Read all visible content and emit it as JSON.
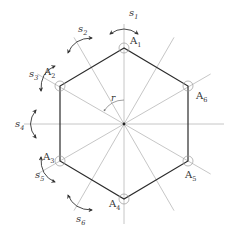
{
  "diagram": {
    "center": {
      "x": 124,
      "y": 124
    },
    "radius": 76,
    "colors": {
      "hexagon": "#2b2b2b",
      "axis": "#b8b8b8",
      "arrow": "#333333",
      "circle": "#999999"
    },
    "vertices": [
      {
        "label": "A",
        "sub": "1",
        "x": 124,
        "y": 48,
        "lx": 130,
        "ly": 44
      },
      {
        "label": "A",
        "sub": "2",
        "x": 60,
        "y": 86,
        "lx": 44,
        "ly": 75
      },
      {
        "label": "A",
        "sub": "3",
        "x": 60,
        "y": 161,
        "lx": 43,
        "ly": 160
      },
      {
        "label": "A",
        "sub": "4",
        "x": 124,
        "y": 199,
        "lx": 109,
        "ly": 207
      },
      {
        "label": "A",
        "sub": "5",
        "x": 188,
        "y": 161,
        "lx": 185,
        "ly": 178
      },
      {
        "label": "A",
        "sub": "6",
        "x": 188,
        "y": 86,
        "lx": 196,
        "ly": 99
      }
    ],
    "axes": [
      {
        "label": "s",
        "sub": "1",
        "angle": 90,
        "lx": 129,
        "ly": 16
      },
      {
        "label": "s",
        "sub": "2",
        "angle": 120,
        "lx": 78,
        "ly": 32
      },
      {
        "label": "s",
        "sub": "3",
        "angle": 150,
        "lx": 29,
        "ly": 77
      },
      {
        "label": "s",
        "sub": "4",
        "angle": 180,
        "lx": 15,
        "ly": 127
      },
      {
        "label": "s",
        "sub": "5",
        "angle": 210,
        "lx": 35,
        "ly": 178
      },
      {
        "label": "s",
        "sub": "6",
        "angle": 240,
        "lx": 76,
        "ly": 222
      }
    ],
    "rotation": {
      "label": "r"
    }
  }
}
